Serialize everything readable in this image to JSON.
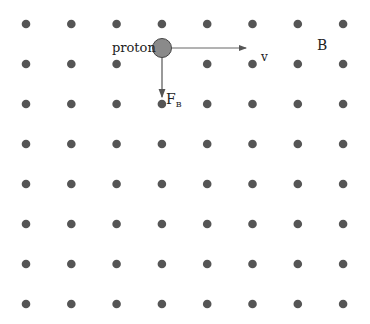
{
  "diagram": {
    "labels": {
      "particle": "proton",
      "velocity": "v",
      "field": "B",
      "force_main": "F",
      "force_sub": "B"
    },
    "colors": {
      "dot": "#555555",
      "proton_fill": "#8a8a8a",
      "proton_stroke": "#444444",
      "arrow": "#555555",
      "text": "#222222"
    },
    "grid": {
      "columns": 8,
      "rows": 8,
      "description": "magnetic field pointing out of page (dots)"
    }
  }
}
